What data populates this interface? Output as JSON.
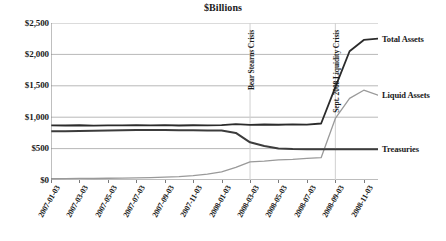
{
  "chart_data": {
    "type": "line",
    "title": "$Billions",
    "xlabel": "",
    "ylabel": "",
    "ylim": [
      0,
      2500
    ],
    "ytick_values": [
      0,
      500,
      1000,
      1500,
      2000,
      2500
    ],
    "ytick_labels": [
      "$0",
      "$500",
      "$1,000",
      "$1,500",
      "$2,000",
      "$2,500"
    ],
    "grid": "horizontal",
    "legend_position": "right-inline",
    "x": [
      "2007-01-03",
      "2007-02-03",
      "2007-03-03",
      "2007-04-03",
      "2007-05-03",
      "2007-06-03",
      "2007-07-03",
      "2007-08-03",
      "2007-09-03",
      "2007-10-03",
      "2007-11-03",
      "2007-12-03",
      "2008-01-03",
      "2008-02-03",
      "2008-03-03",
      "2008-04-03",
      "2008-05-03",
      "2008-06-03",
      "2008-07-03",
      "2008-08-03",
      "2008-09-03",
      "2008-10-03",
      "2008-11-03",
      "2008-12-03"
    ],
    "xtick_labels": [
      "2007-01-03",
      "2007-03-03",
      "2007-05-03",
      "2007-07-03",
      "2007-09-03",
      "2007-11-03",
      "2008-01-03",
      "2008-03-03",
      "2008-05-03",
      "2008-07-03",
      "2008-09-03",
      "2008-11-03"
    ],
    "series": [
      {
        "name": "Total Assets",
        "color": "#2b2b2b",
        "width": 1.8,
        "label": "Total Assets",
        "values": [
          870,
          868,
          872,
          866,
          871,
          869,
          874,
          870,
          873,
          868,
          872,
          870,
          875,
          890,
          878,
          884,
          880,
          886,
          882,
          900,
          1480,
          2050,
          2230,
          2250
        ]
      },
      {
        "name": "Liquid Assets",
        "color": "#9a9a9a",
        "width": 1.3,
        "label": "Liquid Assets",
        "values": [
          20,
          22,
          25,
          24,
          28,
          30,
          35,
          38,
          45,
          55,
          70,
          95,
          130,
          200,
          290,
          300,
          320,
          330,
          345,
          355,
          980,
          1300,
          1430,
          1350
        ]
      },
      {
        "name": "Treasuries",
        "color": "#3c3c3c",
        "width": 2.0,
        "label": "Treasuries",
        "values": [
          775,
          778,
          782,
          785,
          790,
          792,
          795,
          796,
          795,
          793,
          792,
          790,
          788,
          750,
          600,
          540,
          500,
          492,
          490,
          490,
          488,
          489,
          490,
          490
        ]
      }
    ],
    "annotations": [
      {
        "text": "Bear Stearns Crisis",
        "x": "2008-03-03",
        "rotation": -90
      },
      {
        "text": "Sept. 2008 Liquidity Crisis",
        "x": "2008-09-03",
        "rotation": -90
      }
    ]
  }
}
